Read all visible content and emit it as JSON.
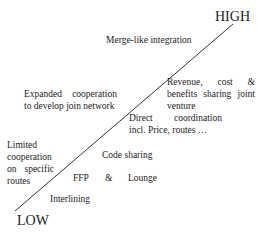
{
  "axis": {
    "high": "HIGH",
    "low": "LOW"
  },
  "labels": {
    "merge": "Merge-like integration",
    "expanded_1": [
      "Expanded",
      "cooperation"
    ],
    "expanded_2": "to develop join network",
    "revenue_1": [
      "Revenue,",
      "cost",
      "&"
    ],
    "revenue_2": [
      "benefits",
      "sharing",
      "joint"
    ],
    "revenue_3": "venture",
    "direct_1": [
      "Direct",
      "coordination"
    ],
    "direct_2": "incl. Price, routes …",
    "limited_1": "Limited",
    "limited_2": "cooperation",
    "limited_3": [
      "on",
      "specific"
    ],
    "limited_4": "routes",
    "code_sharing": "Code sharing",
    "ffp": "FFP",
    "amp": "&",
    "lounge": "Lounge",
    "interlining": "Interlining"
  },
  "colors": {
    "line": "#333333",
    "text": "#222222"
  }
}
